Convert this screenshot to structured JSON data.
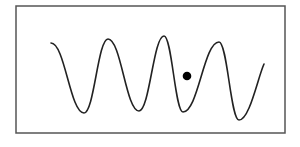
{
  "figure": {
    "frame": {
      "x": 16,
      "y": 6,
      "width": 269,
      "height": 127,
      "stroke": "#555555"
    },
    "wave": {
      "stroke": "#222222",
      "stroke_width": 1.6,
      "points": [
        [
          51,
          43
        ],
        [
          84,
          113
        ],
        [
          108,
          39
        ],
        [
          139,
          111
        ],
        [
          164,
          36
        ],
        [
          183,
          112
        ],
        [
          219,
          42
        ],
        [
          239,
          120
        ],
        [
          264,
          64
        ]
      ]
    },
    "marker": {
      "cx": 187,
      "cy": 76,
      "r": 4.3,
      "fill": "#000000"
    }
  }
}
